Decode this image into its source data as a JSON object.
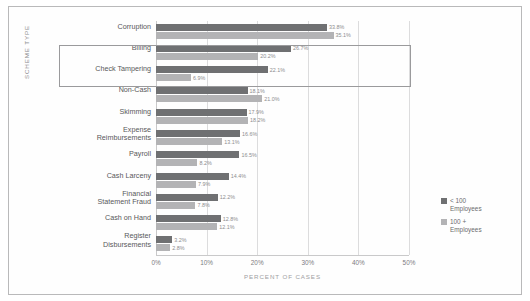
{
  "chart_data": {
    "type": "bar",
    "orientation": "horizontal",
    "title": "",
    "xlabel": "PERCENT OF CASES",
    "ylabel": "SCHEME TYPE",
    "xlim": [
      0,
      50
    ],
    "xticks": [
      "0%",
      "10%",
      "20%",
      "30%",
      "40%",
      "50%"
    ],
    "xtick_values": [
      0,
      10,
      20,
      30,
      40,
      50
    ],
    "grid": true,
    "legend_position": "right",
    "categories": [
      "Corruption",
      "Billing",
      "Check Tampering",
      "Non-Cash",
      "Skimming",
      "Expense\nReimbursements",
      "Payroll",
      "Cash Larceny",
      "Financial\nStatement Fraud",
      "Cash on Hand",
      "Register\nDisbursements"
    ],
    "series": [
      {
        "name": "< 100\nEmployees",
        "color": "#6f7072",
        "values": [
          33.8,
          26.7,
          22.1,
          18.1,
          17.9,
          16.6,
          16.5,
          14.4,
          12.2,
          12.8,
          3.2
        ],
        "labels": [
          "33.8%",
          "26.7%",
          "22.1%",
          "18.1%",
          "17.9%",
          "16.6%",
          "16.5%",
          "14.4%",
          "12.2%",
          "12.8%",
          "3.2%"
        ]
      },
      {
        "name": "100 +\nEmployees",
        "color": "#b3b3b5",
        "values": [
          35.1,
          20.2,
          6.9,
          21.0,
          18.2,
          13.1,
          8.2,
          7.9,
          7.8,
          12.1,
          2.8
        ],
        "labels": [
          "35.1%",
          "20.2%",
          "6.9%",
          "21.0%",
          "18.2%",
          "13.1%",
          "8.2%",
          "7.9%",
          "7.8%",
          "12.1%",
          "2.8%"
        ]
      }
    ],
    "highlight": {
      "categories": [
        "Billing",
        "Check Tampering"
      ],
      "border_color": "#9a9a9c"
    }
  }
}
